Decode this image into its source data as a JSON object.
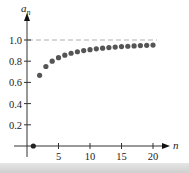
{
  "chart_data": {
    "type": "scatter",
    "title": "",
    "xlabel": "n",
    "ylabel": "a_n",
    "x": [
      1,
      2,
      3,
      4,
      5,
      6,
      7,
      8,
      9,
      10,
      11,
      12,
      13,
      14,
      15,
      16,
      17,
      18,
      19,
      20
    ],
    "values": [
      0,
      0.667,
      0.75,
      0.8,
      0.833,
      0.857,
      0.875,
      0.889,
      0.9,
      0.909,
      0.917,
      0.923,
      0.929,
      0.933,
      0.938,
      0.941,
      0.944,
      0.947,
      0.95,
      0.952
    ],
    "xlim": [
      0,
      21
    ],
    "ylim": [
      0,
      1.1
    ],
    "x_ticks": [
      5,
      10,
      15,
      20
    ],
    "y_ticks": [
      0.2,
      0.4,
      0.6,
      0.8,
      1.0
    ],
    "y_tick_labels": [
      "0.2",
      "0.4",
      "0.6",
      "0.8",
      "1.0"
    ],
    "x_tick_labels": [
      "5",
      "10",
      "15",
      "20"
    ],
    "asymptote": {
      "y": 1.0,
      "style": "dashed"
    },
    "grid": false,
    "legend": null
  },
  "axes": {
    "y_label_main": "a",
    "y_label_sub": "n",
    "x_label": "n"
  },
  "colors": {
    "point": "#555555",
    "axis": "#333333",
    "asymptote": "#b0b0b0"
  }
}
